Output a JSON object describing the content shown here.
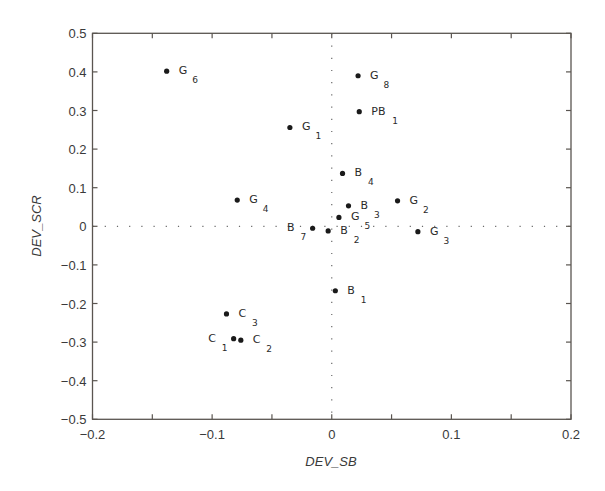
{
  "chart_data": {
    "type": "scatter",
    "title": "",
    "xlabel": "DEV_SB",
    "ylabel": "DEV_SCR",
    "xlim": [
      -0.2,
      0.2
    ],
    "ylim": [
      -0.5,
      0.5
    ],
    "x_ticks": [
      -0.2,
      -0.1,
      0,
      0.1,
      0.2
    ],
    "x_tick_labels": [
      "−0.2",
      "−0.1",
      "0",
      "0.1",
      "0.2"
    ],
    "x_minor_ticks": [
      -0.15,
      -0.05,
      0.05,
      0.15
    ],
    "y_ticks": [
      0.5,
      0.4,
      0.3,
      0.2,
      0.1,
      0,
      -0.1,
      -0.2,
      -0.3,
      -0.4,
      -0.5
    ],
    "y_tick_labels": [
      "0.5",
      "0.4",
      "0.3",
      "0.2",
      "0.1",
      "0",
      "−0.1",
      "−0.2",
      "−0.3",
      "−0.4",
      "−0.5"
    ],
    "grid": false,
    "reference_lines": {
      "x": 0,
      "y": 0,
      "style": "dotted"
    },
    "legend": null,
    "points": [
      {
        "name": "G",
        "sub": "6",
        "x": -0.138,
        "y": 0.402,
        "label_side": "right"
      },
      {
        "name": "G",
        "sub": "8",
        "x": 0.022,
        "y": 0.39,
        "label_side": "right"
      },
      {
        "name": "PB",
        "sub": "1",
        "x": 0.023,
        "y": 0.297,
        "label_side": "right"
      },
      {
        "name": "G",
        "sub": "1",
        "x": -0.035,
        "y": 0.256,
        "label_side": "right"
      },
      {
        "name": "B",
        "sub": "4",
        "x": 0.009,
        "y": 0.137,
        "label_side": "right"
      },
      {
        "name": "G",
        "sub": "4",
        "x": -0.079,
        "y": 0.068,
        "label_side": "right"
      },
      {
        "name": "G",
        "sub": "2",
        "x": 0.055,
        "y": 0.066,
        "label_side": "right"
      },
      {
        "name": "B",
        "sub": "3",
        "x": 0.014,
        "y": 0.053,
        "label_side": "right"
      },
      {
        "name": "G",
        "sub": "5",
        "x": 0.006,
        "y": 0.023,
        "label_side": "right"
      },
      {
        "name": "B",
        "sub": "7",
        "x": -0.016,
        "y": -0.005,
        "label_side": "left"
      },
      {
        "name": "B",
        "sub": "2",
        "x": -0.003,
        "y": -0.012,
        "label_side": "right"
      },
      {
        "name": "G",
        "sub": "3",
        "x": 0.072,
        "y": -0.014,
        "label_side": "right"
      },
      {
        "name": "B",
        "sub": "1",
        "x": 0.003,
        "y": -0.167,
        "label_side": "right"
      },
      {
        "name": "C",
        "sub": "3",
        "x": -0.088,
        "y": -0.227,
        "label_side": "right"
      },
      {
        "name": "C",
        "sub": "1",
        "x": -0.082,
        "y": -0.291,
        "label_side": "left"
      },
      {
        "name": "C",
        "sub": "2",
        "x": -0.076,
        "y": -0.295,
        "label_side": "right"
      }
    ]
  },
  "colors": {
    "background": "#ffffff",
    "frame": "#5a5550",
    "text": "#3a3a3a",
    "marker": "#1a1a1a",
    "reference_line": "#6a6a6a"
  }
}
